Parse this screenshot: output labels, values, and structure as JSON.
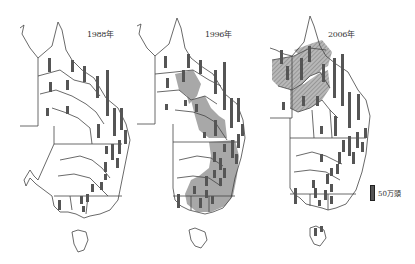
{
  "figure": {
    "panels": [
      {
        "year_label": "1988年"
      },
      {
        "year_label": "1996年"
      },
      {
        "year_label": "2006年"
      }
    ],
    "legend": {
      "label": "50万頭",
      "icon": "bar-symbol"
    },
    "colors": {
      "outline": "#444444",
      "shaded_region": "#a8a8a8",
      "hatched_region": "#9a9a9a",
      "bar": "#555555"
    }
  }
}
